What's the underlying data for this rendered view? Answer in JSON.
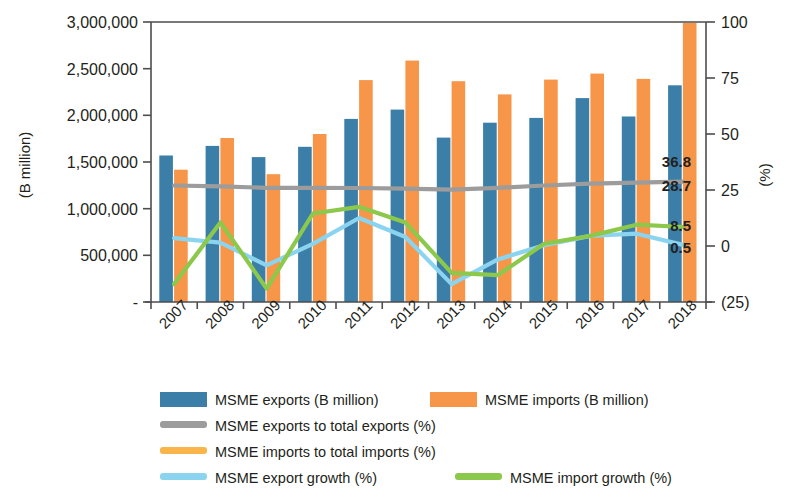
{
  "chart_data": {
    "type": "bar",
    "title": "",
    "subtitle": "",
    "xlabel": "",
    "ylabel": "(B million)",
    "y2label": "(%)",
    "grid": false,
    "legend_position": "bottom",
    "categories": [
      "2007",
      "2008",
      "2009",
      "2010",
      "2011",
      "2012",
      "2013",
      "2014",
      "2015",
      "2016",
      "2017",
      "2018"
    ],
    "ylim": [
      0,
      3000000
    ],
    "yticks": [
      0,
      500000,
      1000000,
      1500000,
      2000000,
      2500000,
      3000000
    ],
    "ytick_labels": [
      "-",
      "500,000",
      "1,000,000",
      "1,500,000",
      "2,000,000",
      "2,500,000",
      "3,000,000"
    ],
    "y2lim": [
      -25,
      100
    ],
    "y2ticks": [
      -25,
      0,
      25,
      50,
      75,
      100
    ],
    "y2tick_labels": [
      "(25)",
      "0",
      "25",
      "50",
      "75",
      "100"
    ],
    "series": [
      {
        "name": "MSME exports (B million)",
        "type": "bar",
        "axis": "left",
        "color": "#3b7ea8",
        "values": [
          1570000,
          1672000,
          1552000,
          1663000,
          1962000,
          2061000,
          1761000,
          1921000,
          1973000,
          2185000,
          1988000,
          2322000
        ]
      },
      {
        "name": "MSME imports (B million)",
        "type": "bar",
        "axis": "left",
        "color": "#f79548",
        "values": [
          1418000,
          1757000,
          1369000,
          1800000,
          2378000,
          2586000,
          2366000,
          2224000,
          2383000,
          2447000,
          2390000,
          2990000
        ]
      },
      {
        "name": "MSME exports to total exports (%)",
        "type": "line",
        "axis": "right",
        "color": "#9c9c9c",
        "values": [
          27.0,
          26.6,
          26.0,
          26.0,
          25.9,
          25.6,
          25.2,
          26.0,
          27.0,
          27.8,
          28.3,
          28.7
        ],
        "end_label": "28.7"
      },
      {
        "name": "MSME imports to total imports (%)",
        "type": "line",
        "axis": "right",
        "color": "#f9b githubusercontent",
        "values": [
          27.2,
          27.0,
          26.3,
          27.0,
          28.0,
          28.6,
          28.2,
          29.0,
          31.8,
          33.6,
          34.9,
          36.8
        ],
        "end_label": "36.8"
      },
      {
        "name": "MSME export growth (%)",
        "type": "line",
        "axis": "right",
        "color": "#8bd4f0",
        "values": [
          3.5,
          1.5,
          -8.6,
          1.0,
          12.5,
          4.0,
          -17.0,
          -6.0,
          0.3,
          4.5,
          5.5,
          0.5
        ],
        "end_label": "0.5"
      },
      {
        "name": "MSME import growth (%)",
        "type": "line",
        "axis": "right",
        "color": "#8cc84b",
        "values": [
          -17.0,
          10.5,
          -19.0,
          14.5,
          17.5,
          10.5,
          -12.0,
          -13.0,
          1.0,
          4.5,
          9.5,
          8.5
        ],
        "end_label": "8.5"
      }
    ],
    "annotations": [
      {
        "text": "36.8",
        "value": 36.8,
        "color": "#231f20"
      },
      {
        "text": "28.7",
        "value": 28.7,
        "color": "#231f20"
      },
      {
        "text": "8.5",
        "value": 8.5,
        "color": "#231f20"
      },
      {
        "text": "0.5",
        "value": 0.5,
        "color": "#231f20"
      }
    ]
  },
  "legend": {
    "items": [
      {
        "label": "MSME exports (B million)",
        "swatch": "bar",
        "color": "#3b7ea8"
      },
      {
        "label": "MSME imports (B million)",
        "swatch": "bar",
        "color": "#f79548"
      },
      {
        "label": "MSME exports to total exports (%)",
        "swatch": "line",
        "color": "#9c9c9c"
      },
      {
        "label": "MSME imports to total imports (%)",
        "swatch": "line",
        "color": "#f9b44a"
      },
      {
        "label": "MSME export growth (%)",
        "swatch": "line",
        "color": "#8bd4f0"
      },
      {
        "label": "MSME import growth (%)",
        "swatch": "line",
        "color": "#8cc84b"
      }
    ]
  },
  "colors": {
    "exports_bar": "#3b7ea8",
    "imports_bar": "#f79548",
    "exports_share_line": "#9c9c9c",
    "imports_share_line": "#f9b44a",
    "export_growth_line": "#8bd4f0",
    "import_growth_line": "#8cc84b",
    "axis": "#4d4d4d",
    "text": "#231f20"
  }
}
